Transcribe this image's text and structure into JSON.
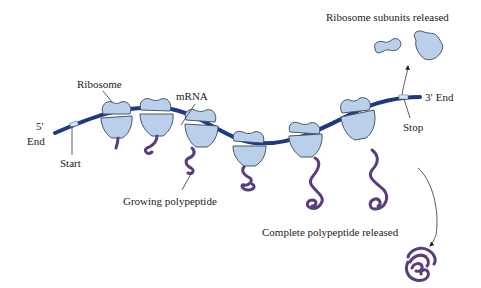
{
  "diagram": {
    "type": "biology-process",
    "colors": {
      "mrna": "#1f3a82",
      "ribosome_fill": "#b9cfea",
      "ribosome_stroke": "#4a5566",
      "polypeptide": "#5a3d7e",
      "text": "#222222"
    },
    "labels": {
      "ribosome": "Ribosome",
      "mrna": "mRNA",
      "five_prime": "5′",
      "five_prime_end": "End",
      "start": "Start",
      "growing_polypeptide": "Growing polypeptide",
      "stop": "Stop",
      "three_prime_end": "3′ End",
      "subunits_released": "Ribosome subunits released",
      "complete_released": "Complete polypeptide released"
    },
    "ribosome_count": 6,
    "nodes": [
      {
        "id": "mrna-strand",
        "label": "mRNA"
      },
      {
        "id": "ribosome-1"
      },
      {
        "id": "ribosome-2"
      },
      {
        "id": "ribosome-3"
      },
      {
        "id": "ribosome-4"
      },
      {
        "id": "ribosome-5"
      },
      {
        "id": "ribosome-6"
      },
      {
        "id": "start-codon",
        "label": "Start"
      },
      {
        "id": "stop-codon",
        "label": "Stop"
      },
      {
        "id": "released-subunits",
        "label": "Ribosome subunits released"
      },
      {
        "id": "released-polypeptide",
        "label": "Complete polypeptide released"
      }
    ],
    "edges": [
      {
        "from": "stop-codon",
        "to": "released-subunits",
        "type": "arrow"
      },
      {
        "from": "stop-codon",
        "to": "released-polypeptide",
        "type": "arrow"
      }
    ]
  }
}
